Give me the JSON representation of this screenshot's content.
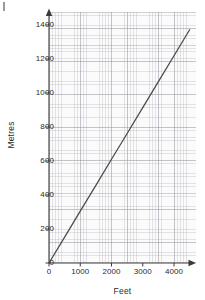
{
  "chart_data": {
    "type": "line",
    "title": "",
    "subtitle": "",
    "xlabel": "Feet",
    "ylabel": "Metres",
    "xlim": [
      0,
      4700
    ],
    "ylim": [
      0,
      1480
    ],
    "xticks": [
      0,
      1000,
      2000,
      3000,
      4000
    ],
    "xtick_labels": [
      "0",
      "1000",
      "2000",
      "3000",
      "4000"
    ],
    "yticks": [
      0,
      200,
      400,
      600,
      800,
      1000,
      1200,
      1400
    ],
    "ytick_labels": [
      "0",
      "200",
      "400",
      "600",
      "800",
      "1000",
      "1200",
      "1400"
    ],
    "grid": true,
    "grid_minor": true,
    "legend": false,
    "legend_position": "none",
    "series": [
      {
        "name": "feet-to-metres conversion",
        "color": "#4a4a4a",
        "x": [
          0,
          500,
          1000,
          1500,
          2000,
          2500,
          3000,
          3500,
          4000,
          4500
        ],
        "values": [
          0,
          152,
          305,
          457,
          610,
          762,
          914,
          1067,
          1219,
          1372
        ]
      }
    ],
    "annotations": []
  },
  "axes": {
    "y_title": "Metres",
    "x_title": "Feet",
    "arrow_x": true,
    "arrow_y": true,
    "axis_color": "#3a3a3a",
    "grid_color": "#b0b0b8",
    "line_color": "#4a4a4a",
    "background": "#fbfbfc"
  }
}
